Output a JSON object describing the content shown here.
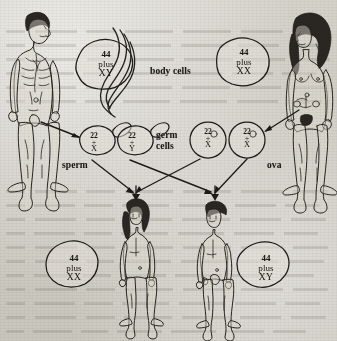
{
  "figure": {
    "labels": {
      "body_cells": "body cells",
      "germ_cells": "germ cells",
      "sperm": "sperm",
      "ova": "ova"
    }
  },
  "parents": [
    {
      "name": "father",
      "sex": "male",
      "position": "top-left"
    },
    {
      "name": "mother",
      "sex": "female",
      "position": "top-right"
    }
  ],
  "children": [
    {
      "name": "daughter",
      "sex": "female",
      "position": "bottom-left"
    },
    {
      "name": "son",
      "sex": "male",
      "position": "bottom-right"
    }
  ],
  "body_cells": [
    {
      "id": "father-body-cell",
      "count": "44",
      "plus": "plus",
      "chromosomes": "XY"
    },
    {
      "id": "mother-body-cell",
      "count": "44",
      "plus": "plus",
      "chromosomes": "XX"
    }
  ],
  "germ_cells": [
    {
      "id": "sperm-x",
      "count": "22",
      "operator": "+",
      "chromosome": "X",
      "type": "sperm"
    },
    {
      "id": "sperm-y",
      "count": "22",
      "operator": "+",
      "chromosome": "Y",
      "type": "sperm"
    },
    {
      "id": "ovum-x-1",
      "count": "22",
      "operator": "+",
      "chromosome": "X",
      "type": "ovum"
    },
    {
      "id": "ovum-x-2",
      "count": "22",
      "operator": "+",
      "chromosome": "X",
      "type": "ovum"
    }
  ],
  "offspring_cells": [
    {
      "id": "daughter-body-cell",
      "count": "44",
      "plus": "plus",
      "chromosomes": "XX"
    },
    {
      "id": "son-body-cell",
      "count": "44",
      "plus": "plus",
      "chromosomes": "XY"
    }
  ],
  "colors": {
    "ink": "#1d1b18",
    "paper": "#cdcac1",
    "cell_fill": "#e3e0d8"
  }
}
